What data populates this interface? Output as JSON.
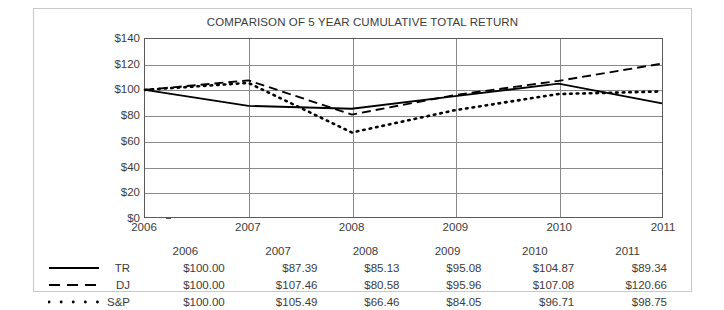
{
  "chart_data": {
    "type": "line",
    "title": "COMPARISON OF 5 YEAR CUMULATIVE TOTAL RETURN",
    "xlabel": "",
    "ylabel": "",
    "categories": [
      "2006",
      "2007",
      "2008",
      "2009",
      "2010",
      "2011"
    ],
    "ylim": [
      0,
      140
    ],
    "yticks": [
      "$0",
      "$20",
      "$40",
      "$60",
      "$80",
      "$100",
      "$120",
      "$140"
    ],
    "ytick_values": [
      0,
      20,
      40,
      60,
      80,
      100,
      120,
      140
    ],
    "grid": "both",
    "legend_position": "table-below",
    "series": [
      {
        "name": "TR",
        "style": "solid",
        "values": [
          100.0,
          87.39,
          85.13,
          95.08,
          104.87,
          89.34
        ],
        "labels": [
          "$100.00",
          "$87.39",
          "$85.13",
          "$95.08",
          "$104.87",
          "$89.34"
        ]
      },
      {
        "name": "DJ",
        "style": "dashed",
        "values": [
          100.0,
          107.46,
          80.58,
          95.96,
          107.08,
          120.66
        ],
        "labels": [
          "$100.00",
          "$107.46",
          "$80.58",
          "$95.96",
          "$107.08",
          "$120.66"
        ]
      },
      {
        "name": "S&P",
        "style": "dotted",
        "values": [
          100.0,
          105.49,
          66.46,
          84.05,
          96.71,
          98.75
        ],
        "labels": [
          "$100.00",
          "$105.49",
          "$66.46",
          "$84.05",
          "$96.71",
          "$98.75"
        ]
      }
    ]
  },
  "colors": {
    "line": "#000000",
    "grid": "#8a8a8a",
    "axis": "#5a5a5a",
    "text": "#3c3c3c",
    "frame": "#c9c9c9"
  }
}
